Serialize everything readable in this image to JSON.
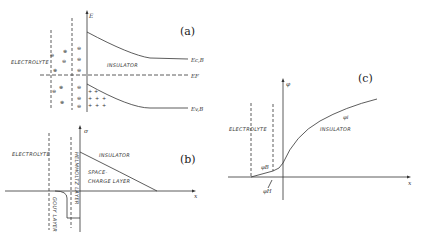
{
  "figure": {
    "panel_a": {
      "label": "(a)",
      "axis_label": "E",
      "regions": {
        "electrolyte": "ELECTROLYTE",
        "insulator": "INSULATOR"
      },
      "levels": {
        "conduction": "Ec,B",
        "fermi": "EF",
        "valence": "Ev,B"
      },
      "ion_signs": {
        "positive": "⊕",
        "negative": "⊖",
        "hole": "+"
      }
    },
    "panel_b": {
      "label": "(b)",
      "y_axis_label": "σ",
      "x_axis_label": "x",
      "regions": {
        "electrolyte": "ELECTROLYTE",
        "insulator": "INSULATOR",
        "space_charge": "SPACE-",
        "space_charge_2": "CHARGE LAYER",
        "gouy": "GOUY LAYER",
        "helmholtz": "HELMHOLTZ LAYER"
      }
    },
    "panel_c": {
      "label": "(c)",
      "y_axis_label": "φ",
      "x_axis_label": "x",
      "regions": {
        "electrolyte": "ELECTROLYTE",
        "insulator": "INSULATOR"
      },
      "potentials": {
        "insulator": "φi",
        "gouy": "φB",
        "helmholtz": "φH"
      }
    }
  }
}
